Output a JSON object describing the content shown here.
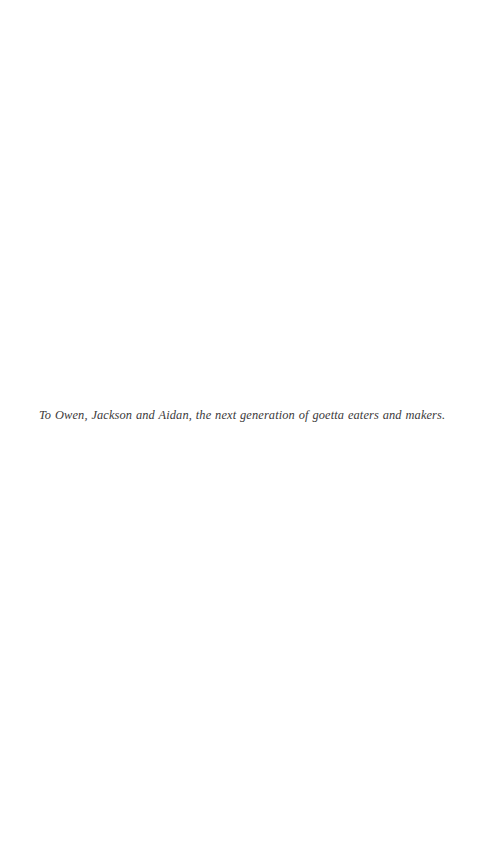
{
  "page": {
    "background_color": "#ffffff",
    "width": 482,
    "height": 858,
    "kind": "book-dedication-page"
  },
  "dedication": {
    "text": "To Owen, Jackson and Aidan, the next generation of goetta eaters and makers.",
    "color": "#2e2c2d",
    "style": "italic-serif"
  }
}
